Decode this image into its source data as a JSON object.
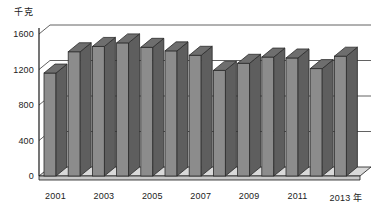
{
  "chart_data": {
    "type": "bar",
    "title": "",
    "subtitle": "",
    "xlabel": "年",
    "ylabel": "千克",
    "unit_label": "千克",
    "categories": [
      "2001",
      "2002",
      "2003",
      "2004",
      "2005",
      "2006",
      "2007",
      "2008",
      "2009",
      "2010",
      "2011",
      "2012",
      "2013"
    ],
    "values": [
      1160,
      1400,
      1460,
      1500,
      1450,
      1410,
      1360,
      1190,
      1270,
      1340,
      1330,
      1210,
      1350
    ],
    "x_tick_labels": [
      "2001",
      "2003",
      "2005",
      "2007",
      "2009",
      "2011",
      "2013 年"
    ],
    "x_tick_categories": [
      "2001",
      "2003",
      "2005",
      "2007",
      "2009",
      "2011",
      "2013"
    ],
    "y_ticks": [
      0,
      400,
      800,
      1200,
      1600
    ],
    "y_tick_labels": [
      "0",
      "400",
      "800",
      "1200",
      "1600"
    ],
    "ylim": [
      0,
      1600
    ],
    "grid": true,
    "grid_axis": "y",
    "legend": false,
    "legend_position": "none",
    "three_d": true,
    "bar_face_color": "#8c8c8c",
    "bar_side_color": "#5e5e5e",
    "bar_top_color": "#6e6e6e",
    "bar_outline_color": "#2b2b2b",
    "axis_color": "#1a1a1a",
    "grid_color": "#3a3a3a",
    "floor_color": "#d9d9d9",
    "background_color": "#ffffff"
  },
  "geometry": {
    "plot_left": 39,
    "plot_right": 360,
    "baseline_y": 176,
    "top_y": 34,
    "depth_x": 11,
    "depth_y": 9,
    "bar_width": 12,
    "bar_pitch": 24.2,
    "first_bar_x": 44
  }
}
